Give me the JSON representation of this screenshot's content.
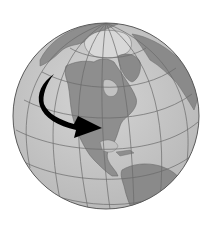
{
  "figure": {
    "projection": "orthographic",
    "center": {
      "x": 106,
      "y": 116
    },
    "radius": 93,
    "colors": {
      "background": "#ffffff",
      "ocean": "#c8c8c8",
      "land": "#8e8e8e",
      "ice": "#d6d6d6",
      "graticule": "#6a6a6a",
      "outline": "#5a5a5a",
      "arrow": "#000000"
    },
    "annotation": {
      "type": "curved-arrow",
      "direction": "from Pacific northwest coast curving down and east into central United States"
    }
  }
}
